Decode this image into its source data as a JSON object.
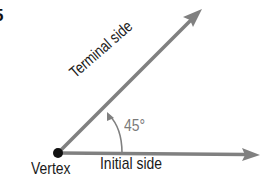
{
  "figure": {
    "number_fragment": "5",
    "labels": {
      "terminal_side": "Terminal side",
      "initial_side": "Initial side",
      "vertex": "Vertex",
      "angle": "45°"
    },
    "colors": {
      "ray": "#808080",
      "vertex_dot": "#111111",
      "angle_text": "#7a7a7a",
      "text": "#1a1a1a"
    },
    "angle_degrees": 45
  }
}
